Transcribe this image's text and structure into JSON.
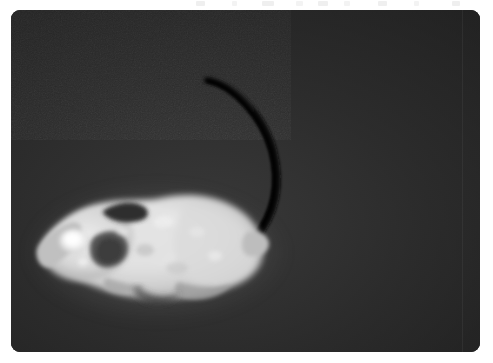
{
  "page": {
    "background_color": "#ffffff",
    "width": 493,
    "height": 363
  },
  "photo": {
    "label": "Grayscale infrared photograph of a laboratory mouse",
    "panel": {
      "x": 11,
      "y": 10,
      "width": 469,
      "height": 342,
      "corner_radius": 9,
      "background_color": "#262626",
      "has_noise_texture": true,
      "has_vertical_seam": true,
      "seam_x": 462
    },
    "background": {
      "name": "dark-enclosure-floor",
      "base_color": "#282828",
      "highlight_color": "#3a3a3a",
      "vignette_color": "#141414"
    },
    "subject": {
      "name": "mouse",
      "species_appearance": "white laboratory mouse",
      "orientation": "profile, facing left",
      "body_color": "#dcdcdc",
      "body_highlight_color": "#efefef",
      "body_shadow_color": "#8a8a8a",
      "parts": [
        {
          "name": "snout",
          "color": "#b9b9b9"
        },
        {
          "name": "head",
          "color": "#e2e2e2"
        },
        {
          "name": "eye",
          "color": "#f4f4f4"
        },
        {
          "name": "ear-near",
          "color": "#5a5a5a"
        },
        {
          "name": "ear-far",
          "color": "#3c3c3c"
        },
        {
          "name": "torso",
          "color": "#dedede"
        },
        {
          "name": "haunch",
          "color": "#d2d2d2"
        },
        {
          "name": "rump",
          "color": "#c6c6c6"
        },
        {
          "name": "forelimb",
          "color": "#b4b4b4"
        },
        {
          "name": "hindlimb",
          "color": "#a8a8a8"
        },
        {
          "name": "tail",
          "color": "#0e0e0e"
        }
      ],
      "tail": {
        "name": "tail",
        "color": "#0e0e0e",
        "shape": "curved arc sweeping up and over the back",
        "tip_x": 196,
        "tip_y": 70,
        "base_x": 246,
        "base_y": 228
      }
    }
  },
  "artifacts": {
    "name": "top-edge-scan-artifacts",
    "color": "#ededed",
    "marks": [
      {
        "x": 196,
        "width": 9
      },
      {
        "x": 232,
        "width": 5
      },
      {
        "x": 262,
        "width": 12
      },
      {
        "x": 296,
        "width": 7
      },
      {
        "x": 318,
        "width": 10
      },
      {
        "x": 344,
        "width": 6
      },
      {
        "x": 378,
        "width": 9
      },
      {
        "x": 414,
        "width": 5
      },
      {
        "x": 452,
        "width": 8
      }
    ]
  }
}
